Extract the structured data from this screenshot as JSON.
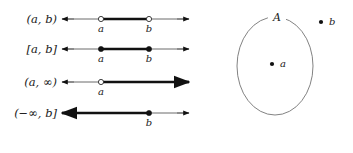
{
  "figure": {
    "width": 353,
    "height": 153,
    "background": "#ffffff",
    "ink_color": "#111111",
    "thin_line_color": "#595959",
    "outline_color": "#6b6b6b"
  },
  "intervals": {
    "rows": [
      {
        "label": "(a, b)",
        "label_plain": "(a,b)",
        "kind": "open-bounded",
        "y": 19,
        "left_point": {
          "name": "a",
          "label": "a",
          "x": 101,
          "style": "open"
        },
        "right_point": {
          "name": "b",
          "label": "b",
          "x": 149,
          "style": "open"
        },
        "segment": {
          "x1": 101,
          "x2": 149
        },
        "axis": {
          "x1": 62,
          "x2": 189
        },
        "left_arrow": true,
        "right_arrow": true
      },
      {
        "label": "[a, b]",
        "label_plain": "[a,b]",
        "kind": "closed-bounded",
        "y": 49,
        "left_point": {
          "name": "a",
          "label": "a",
          "x": 101,
          "style": "closed"
        },
        "right_point": {
          "name": "b",
          "label": "b",
          "x": 149,
          "style": "closed"
        },
        "segment": {
          "x1": 101,
          "x2": 149
        },
        "axis": {
          "x1": 62,
          "x2": 189
        },
        "left_arrow": true,
        "right_arrow": true
      },
      {
        "label": "(a, ∞)",
        "label_plain": "(a,infinity)",
        "kind": "open-ray-right",
        "y": 82,
        "left_point": {
          "name": "a",
          "label": "a",
          "x": 101,
          "style": "open"
        },
        "right_point": null,
        "segment": {
          "x1": 101,
          "x2": 189
        },
        "axis": {
          "x1": 62,
          "x2": 189
        },
        "left_arrow": true,
        "right_arrow": true
      },
      {
        "label": "(−∞, b]",
        "label_plain": "(-infinity,b]",
        "kind": "closed-ray-left",
        "y": 113,
        "left_point": null,
        "right_point": {
          "name": "b",
          "label": "b",
          "x": 149,
          "style": "closed"
        },
        "segment": {
          "x1": 62,
          "x2": 149
        },
        "axis": {
          "x1": 62,
          "x2": 189
        },
        "left_arrow": true,
        "right_arrow": true
      }
    ]
  },
  "set_diagram": {
    "set_label": "A",
    "set_label_x": 277,
    "set_label_y": 21,
    "ellipse": {
      "cx": 275,
      "cy": 66,
      "rx": 38,
      "ry": 49
    },
    "points": [
      {
        "name": "a",
        "label": "a",
        "inside": true,
        "dot_x": 272,
        "dot_y": 64,
        "label_x": 280,
        "label_y": 67
      },
      {
        "name": "b",
        "label": "b",
        "inside": false,
        "dot_x": 321,
        "dot_y": 22,
        "label_x": 329,
        "label_y": 25
      }
    ]
  }
}
